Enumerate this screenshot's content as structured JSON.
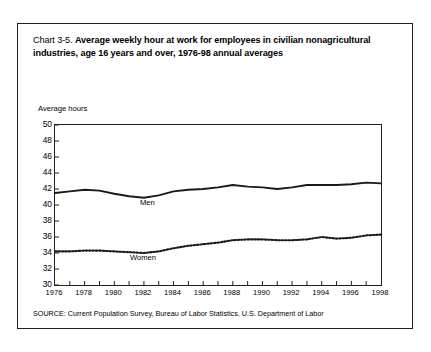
{
  "figure": {
    "title_prefix": "Chart 3-5. ",
    "title_main": "Average weekly hour at work for employees in civilian nonagricultural industries, age 16 years and over, 1976-98 annual averages",
    "source_note": "SOURCE: Current Population Survey, Bureau of Labor Statistics, U.S. Department of Labor"
  },
  "chart_data": {
    "type": "line",
    "title": "Chart 3-5. Average weekly hour at work for employees in civilian nonagricultural industries, age 16 years and over, 1976-98 annual averages",
    "xlabel": "",
    "ylabel": "Average hours",
    "x": [
      1976,
      1977,
      1978,
      1979,
      1980,
      1981,
      1982,
      1983,
      1984,
      1985,
      1986,
      1987,
      1988,
      1989,
      1990,
      1991,
      1992,
      1993,
      1994,
      1995,
      1996,
      1997,
      1998
    ],
    "xlim": [
      1976,
      1998
    ],
    "ylim": [
      30,
      50
    ],
    "y_ticks": [
      30,
      32,
      34,
      36,
      38,
      40,
      42,
      44,
      46,
      48,
      50
    ],
    "x_ticks": [
      1976,
      1978,
      1980,
      1982,
      1984,
      1986,
      1988,
      1990,
      1992,
      1994,
      1996,
      1998
    ],
    "grid": false,
    "legend_position": "inline-labels",
    "series": [
      {
        "name": "Men",
        "style": "solid",
        "color": "#1a1a1a",
        "values": [
          41.5,
          41.7,
          41.9,
          41.8,
          41.4,
          41.1,
          40.9,
          41.2,
          41.7,
          41.9,
          42.0,
          42.2,
          42.5,
          42.3,
          42.2,
          42.0,
          42.2,
          42.5,
          42.5,
          42.5,
          42.6,
          42.8,
          42.7
        ]
      },
      {
        "name": "Women",
        "style": "dotted",
        "color": "#1a1a1a",
        "values": [
          34.2,
          34.2,
          34.3,
          34.3,
          34.2,
          34.1,
          34.0,
          34.2,
          34.6,
          34.9,
          35.1,
          35.3,
          35.6,
          35.7,
          35.7,
          35.6,
          35.6,
          35.7,
          36.0,
          35.8,
          35.9,
          36.2,
          36.3
        ]
      }
    ]
  }
}
